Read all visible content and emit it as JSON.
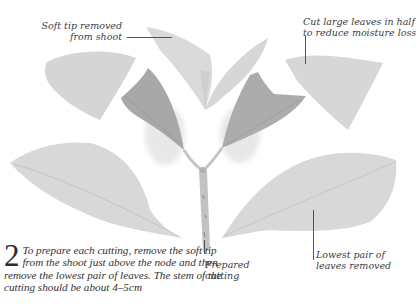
{
  "illustration": {
    "subject": "hydrangea cutting preparation",
    "colors": {
      "leaf_light": "#d9d9d9",
      "leaf_mid": "#c9c9c9",
      "leaf_dark": "#a3a3a3",
      "stem": "#bdbdbd",
      "text": "#3d3d3d",
      "leader_line": "#555555"
    }
  },
  "callouts": {
    "soft_tip": {
      "line1": "Soft tip removed",
      "line2": "from shoot"
    },
    "cut_leaves": {
      "line1": "Cut large leaves in half",
      "line2": "to reduce moisture loss"
    },
    "prepared_cutting": {
      "line1": "Prepared",
      "line2": "cutting"
    },
    "lowest_pair": {
      "line1": "Lowest pair of",
      "line2": "leaves removed"
    }
  },
  "step": {
    "number": "2",
    "text": "To prepare each cutting, remove the soft tip from the shoot just above the node and then remove the lowest pair of leaves. The stem of the cutting should be about 4–5cm"
  }
}
